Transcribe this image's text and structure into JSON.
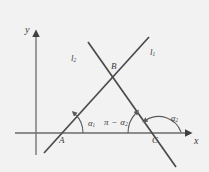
{
  "figure": {
    "kind": "geometry-diagram",
    "background_color": "#f2f2f2",
    "stroke_color": "#4a4a4a",
    "text_color": "#3a3a3a"
  },
  "axes": {
    "x_label": "x",
    "y_label": "y",
    "x_axis": {
      "x1": 15,
      "y1": 133,
      "x2": 190,
      "y2": 133,
      "arrow": "right"
    },
    "y_axis": {
      "x1": 36,
      "y1": 155,
      "x2": 36,
      "y2": 32,
      "arrow": "up"
    }
  },
  "lines": [
    {
      "name": "l1",
      "label": "l",
      "sub": "1",
      "label_x": 150,
      "label_y": 48,
      "x1": 44,
      "y1": 153,
      "x2": 149,
      "y2": 37
    },
    {
      "name": "l2",
      "label": "l",
      "sub": "2",
      "label_x": 71,
      "label_y": 54,
      "x1": 88,
      "y1": 42,
      "x2": 176,
      "y2": 167
    }
  ],
  "points": [
    {
      "name": "A",
      "label": "A",
      "x": 57,
      "y": 133,
      "label_x": 59,
      "label_y": 137
    },
    {
      "name": "B",
      "label": "B",
      "x": 118,
      "y": 78,
      "label_x": 111,
      "label_y": 63
    },
    {
      "name": "C",
      "label": "C",
      "x": 157,
      "y": 133,
      "label_x": 152,
      "label_y": 137
    }
  ],
  "angles": [
    {
      "name": "alpha1",
      "label": "α",
      "sub": "1",
      "label_x": 88,
      "label_y": 120,
      "vertex": "A",
      "description": "angle of inclination of line l1 at point A"
    },
    {
      "name": "pi-minus-alpha2",
      "label": "π − α",
      "sub": "2",
      "label_x": 105,
      "label_y": 120,
      "vertex": "C",
      "description": "supplementary angle at point C measured from positive x direction"
    },
    {
      "name": "alpha2",
      "label": "α",
      "sub": "2",
      "label_x": 172,
      "label_y": 115,
      "vertex": "C",
      "description": "angle of inclination of line l2 at point C"
    }
  ]
}
